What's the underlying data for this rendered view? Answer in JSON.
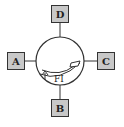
{
  "diagram": {
    "type": "rotary-valve",
    "ports": {
      "top": {
        "label": "D"
      },
      "left": {
        "label": "A"
      },
      "right": {
        "label": "C"
      },
      "bottom": {
        "label": "B"
      }
    },
    "center": {
      "label": "FI",
      "arrow": "curved-flow-arrow",
      "indicator": "up-arrow"
    },
    "colors": {
      "box_fill": "#c8c8c8",
      "stroke": "#333333",
      "background": "#ffffff"
    }
  }
}
